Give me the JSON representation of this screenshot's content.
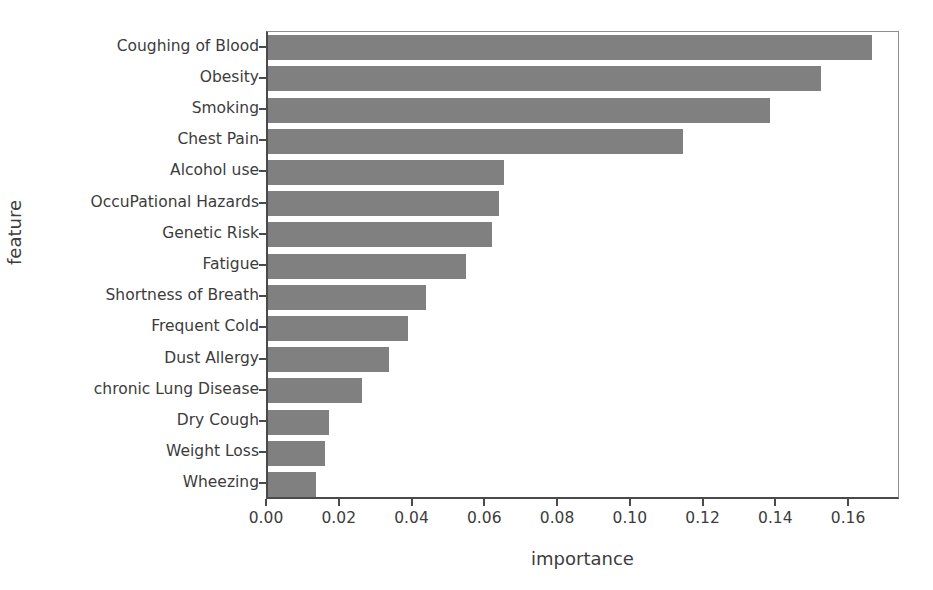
{
  "chart_data": {
    "type": "bar",
    "orientation": "horizontal",
    "title": "",
    "xlabel": "importance",
    "ylabel": "feature",
    "xlim": [
      0.0,
      0.174
    ],
    "grid": false,
    "legend": null,
    "bar_color": "#808080",
    "text_color": "#3c3c3c",
    "axis_color": "#4a4a4a",
    "xticks": [
      "0.00",
      "0.02",
      "0.04",
      "0.06",
      "0.08",
      "0.10",
      "0.12",
      "0.14",
      "0.16"
    ],
    "xtick_values": [
      0.0,
      0.02,
      0.04,
      0.06,
      0.08,
      0.1,
      0.12,
      0.14,
      0.16
    ],
    "categories": [
      "Coughing of Blood",
      "Obesity",
      "Smoking",
      "Chest Pain",
      "Alcohol use",
      "OccuPational Hazards",
      "Genetic Risk",
      "Fatigue",
      "Shortness of Breath",
      "Frequent Cold",
      "Dust Allergy",
      "chronic Lung Disease",
      "Dry Cough",
      "Weight Loss",
      "Wheezing"
    ],
    "values": [
      0.166,
      0.152,
      0.138,
      0.114,
      0.065,
      0.0635,
      0.0615,
      0.0545,
      0.0435,
      0.0385,
      0.0333,
      0.0258,
      0.0168,
      0.0157,
      0.0132
    ]
  }
}
